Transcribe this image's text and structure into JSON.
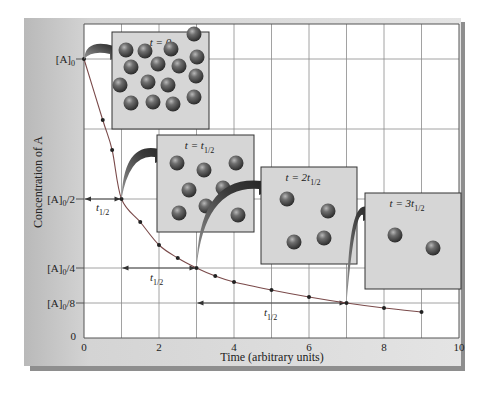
{
  "chart_data": {
    "type": "line",
    "title": "",
    "xlabel": "Time (arbitrary units)",
    "ylabel": "Concentration of A",
    "xlim": [
      0,
      10
    ],
    "x_ticks": [
      0,
      2,
      4,
      6,
      8,
      10
    ],
    "y_ticks": [
      {
        "label": "0",
        "value": 0
      },
      {
        "label": "[A]0/8",
        "base": "[A]",
        "sub": "0",
        "suffix": "/8",
        "value": 0.125
      },
      {
        "label": "[A]0/4",
        "base": "[A]",
        "sub": "0",
        "suffix": "/4",
        "value": 0.25
      },
      {
        "label": "[A]0/2",
        "base": "[A]",
        "sub": "0",
        "suffix": "/2",
        "value": 0.5
      },
      {
        "label": "[A]0",
        "base": "[A]",
        "sub": "0",
        "suffix": "",
        "value": 1.0
      }
    ],
    "grid": true,
    "series": [
      {
        "name": "[A] vs time (first-order decay, t1/2 = 1)",
        "x": [
          0,
          0.5,
          0.75,
          1,
          1.5,
          2,
          2.5,
          3,
          3.5,
          4,
          5,
          6,
          7,
          8,
          9
        ],
        "y": [
          1.0,
          0.71,
          0.59,
          0.5,
          0.35,
          0.28,
          0.22,
          0.25,
          0.22,
          0.2,
          0.17,
          0.15,
          0.125,
          0.11,
          0.09
        ]
      }
    ],
    "half_life_markers": [
      {
        "from": 0,
        "to": 1,
        "level": "[A]0/2",
        "label": "t",
        "sub": "1/2"
      },
      {
        "from": 1,
        "to": 3,
        "level": "[A]0/4",
        "label": "t",
        "sub": "1/2"
      },
      {
        "from": 3,
        "to": 7,
        "level": "[A]0/8",
        "label": "t",
        "sub": "1/2"
      }
    ],
    "annotations": [
      {
        "label": "t = 0",
        "main": "t = 0",
        "sub": "",
        "molecules": 16,
        "at_time": 0
      },
      {
        "label": "t = t1/2",
        "main": "t = t",
        "sub": "1/2",
        "molecules": 8,
        "at_time": 1
      },
      {
        "label": "t = 2t1/2",
        "main": "t = 2t",
        "sub": "1/2",
        "molecules": 4,
        "at_time": 3
      },
      {
        "label": "t = 3t1/2",
        "main": "t = 3t",
        "sub": "1/2",
        "molecules": 2,
        "at_time": 7
      }
    ],
    "legend": "none"
  },
  "colors": {
    "frame": "#c9c9c9",
    "frame_shadow": "#8e8e8e",
    "plot_bg": "#ffffff",
    "grid": "#8a8a8a",
    "curve": "#7a3b3b",
    "point": "#222222",
    "box_bg": "#d3d3d3",
    "box_border": "#333333",
    "molecule": "#5a5a5a",
    "arrow": "#3a3a3a"
  }
}
